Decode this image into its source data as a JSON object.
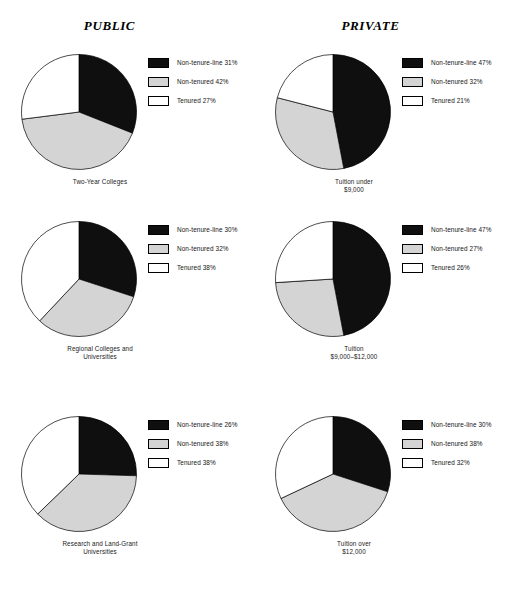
{
  "figure": {
    "columns": [
      {
        "id": "public",
        "heading": "PUBLIC"
      },
      {
        "id": "private",
        "heading": "PRIVATE"
      }
    ],
    "colors": {
      "non_tenure_line": "#100f0f",
      "non_tenured": "#d4d4d4",
      "tenured": "#ffffff",
      "outline": "#000000",
      "background": "#ffffff",
      "text": "#141414"
    }
  },
  "chart_data": [
    {
      "type": "pie",
      "id": "public-two-year",
      "column": "PUBLIC",
      "title": "Two-Year Colleges",
      "caption_lines": [
        "Two-Year Colleges"
      ],
      "categories": [
        "Non-tenure-line",
        "Non-tenured",
        "Tenured"
      ],
      "values": [
        31,
        42,
        27
      ],
      "units": "percent",
      "start_angle_deg": 0,
      "direction": "clockwise",
      "legend_position": "right",
      "legend": [
        {
          "label": "Non-tenure-line 31%",
          "swatch": "black"
        },
        {
          "label": "Non-tenured 42%",
          "swatch": "gray"
        },
        {
          "label": "Tenured 27%",
          "swatch": "white"
        }
      ]
    },
    {
      "type": "pie",
      "id": "private-tuition-under-9000",
      "column": "PRIVATE",
      "title": "Tuition under $9,000",
      "caption_lines": [
        "Tuition under",
        "$9,000"
      ],
      "categories": [
        "Non-tenure-line",
        "Non-tenured",
        "Tenured"
      ],
      "values": [
        47,
        32,
        21
      ],
      "units": "percent",
      "start_angle_deg": 0,
      "direction": "clockwise",
      "legend_position": "right",
      "legend": [
        {
          "label": "Non-tenure-line 47%",
          "swatch": "black"
        },
        {
          "label": "Non-tenured 32%",
          "swatch": "gray"
        },
        {
          "label": "Tenured 21%",
          "swatch": "white"
        }
      ]
    },
    {
      "type": "pie",
      "id": "public-regional",
      "column": "PUBLIC",
      "title": "Regional Colleges and Universities",
      "caption_lines": [
        "Regional Colleges and",
        "Universities"
      ],
      "categories": [
        "Non-tenure-line",
        "Non-tenured",
        "Tenured"
      ],
      "values": [
        30,
        32,
        38
      ],
      "units": "percent",
      "start_angle_deg": 0,
      "direction": "clockwise",
      "legend_position": "right",
      "legend": [
        {
          "label": "Non-tenure-line 30%",
          "swatch": "black"
        },
        {
          "label": "Non-tenured 32%",
          "swatch": "gray"
        },
        {
          "label": "Tenured 38%",
          "swatch": "white"
        }
      ]
    },
    {
      "type": "pie",
      "id": "private-tuition-9000-12000",
      "column": "PRIVATE",
      "title": "Tuition $9,000–$12,000",
      "caption_lines": [
        "Tuition",
        "$9,000–$12,000"
      ],
      "categories": [
        "Non-tenure-line",
        "Non-tenured",
        "Tenured"
      ],
      "values": [
        47,
        27,
        26
      ],
      "units": "percent",
      "start_angle_deg": 0,
      "direction": "clockwise",
      "legend_position": "right",
      "legend": [
        {
          "label": "Non-tenure-line 47%",
          "swatch": "black"
        },
        {
          "label": "Non-tenured 27%",
          "swatch": "gray"
        },
        {
          "label": "Tenured 26%",
          "swatch": "white"
        }
      ]
    },
    {
      "type": "pie",
      "id": "public-research-land-grant",
      "column": "PUBLIC",
      "title": "Research and Land-Grant Universities",
      "caption_lines": [
        "Research and Land-Grant",
        "Universities"
      ],
      "categories": [
        "Non-tenure-line",
        "Non-tenured",
        "Tenured"
      ],
      "values": [
        26,
        38,
        38
      ],
      "units": "percent",
      "start_angle_deg": 0,
      "direction": "clockwise",
      "legend_position": "right",
      "legend": [
        {
          "label": "Non-tenure-line 26%",
          "swatch": "black"
        },
        {
          "label": "Non-tenured 38%",
          "swatch": "gray"
        },
        {
          "label": "Tenured 38%",
          "swatch": "white"
        }
      ]
    },
    {
      "type": "pie",
      "id": "private-tuition-over-12000",
      "column": "PRIVATE",
      "title": "Tuition over $12,000",
      "caption_lines": [
        "Tuition over",
        "$12,000"
      ],
      "categories": [
        "Non-tenure-line",
        "Non-tenured",
        "Tenured"
      ],
      "values": [
        30,
        38,
        32
      ],
      "units": "percent",
      "start_angle_deg": 0,
      "direction": "clockwise",
      "legend_position": "right",
      "legend": [
        {
          "label": "Non-tenure-line 30%",
          "swatch": "black"
        },
        {
          "label": "Non-tenured 38%",
          "swatch": "gray"
        },
        {
          "label": "Tenured 32%",
          "swatch": "white"
        }
      ]
    }
  ]
}
